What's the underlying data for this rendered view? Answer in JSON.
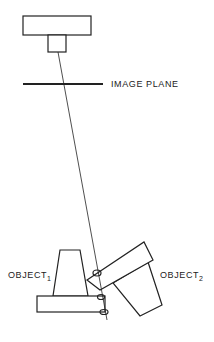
{
  "labels": {
    "image_plane": "IMAGE PLANE",
    "object1": "OBJECT",
    "object1_sub": "1",
    "object2": "OBJECT",
    "object2_sub": "2"
  },
  "colors": {
    "stroke": "#222222",
    "background": "#ffffff"
  }
}
